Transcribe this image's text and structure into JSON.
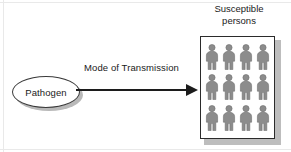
{
  "diagram": {
    "source_node": {
      "label": "Pathogen",
      "shape": "ellipse",
      "border_color": "#3a3a3a",
      "fill_color": "#ffffff"
    },
    "edge": {
      "label": "Mode of Transmission",
      "direction": "left-to-right",
      "arrow_color": "#1c1c1c"
    },
    "target_group": {
      "title_line1": "Susceptible",
      "title_line2": "persons",
      "box_border_color": "#2b2b2b",
      "shadow_color": "#bdbdbd",
      "person_color": "#8c8c8c",
      "person_outline_color": "#6e6e6e",
      "rows": 3,
      "columns": 4,
      "person_count": 12,
      "icon_name": "person-icon"
    }
  }
}
